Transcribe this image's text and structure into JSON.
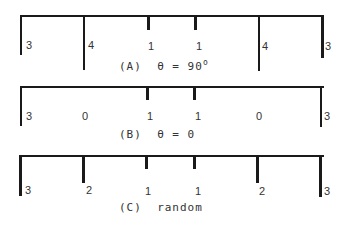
{
  "figure": {
    "panels": [
      {
        "id": "A",
        "caption_prefix": "(A)",
        "caption_text": "θ = 90",
        "caption_suffix": "o",
        "intensities": [
          "3",
          "4",
          "1",
          "1",
          "4",
          "3"
        ]
      },
      {
        "id": "B",
        "caption_prefix": "(B)",
        "caption_text": "θ = 0",
        "caption_suffix": "",
        "intensities": [
          "3",
          "0",
          "1",
          "1",
          "0",
          "3"
        ]
      },
      {
        "id": "C",
        "caption_prefix": "(C)",
        "caption_text": "random",
        "caption_suffix": "",
        "intensities": [
          "3",
          "2",
          "1",
          "1",
          "2",
          "3"
        ]
      }
    ]
  }
}
